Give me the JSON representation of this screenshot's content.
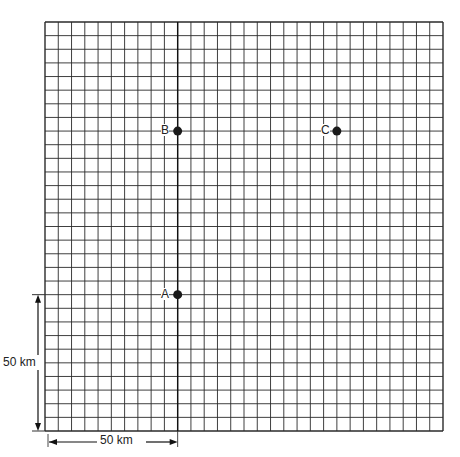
{
  "grid": {
    "columns": 30,
    "rows": 30,
    "cell_km": 5,
    "line_color": "#2a2a2a"
  },
  "points": [
    {
      "label": "A",
      "col": 10,
      "row_from_bottom": 10
    },
    {
      "label": "B",
      "col": 10,
      "row_from_bottom": 22
    },
    {
      "label": "C",
      "col": 22,
      "row_from_bottom": 22
    }
  ],
  "scale": {
    "horizontal_label": "50 km",
    "vertical_label": "50 km"
  }
}
